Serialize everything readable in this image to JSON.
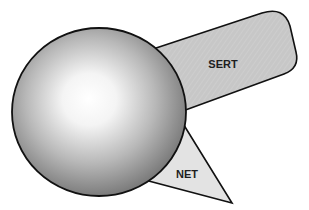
{
  "diagram": {
    "type": "schematic",
    "background": "#ffffff",
    "stroke_color": "#111111",
    "sphere": {
      "label": "",
      "center": [
        99,
        112
      ],
      "radius": 86,
      "highlight_color": "#ffffff",
      "edge_color": "#6e6e6e"
    },
    "sert": {
      "label": "SERT",
      "fill": "#c6c6c6"
    },
    "net": {
      "label": "NET",
      "fill": "#e3e3e3"
    }
  }
}
